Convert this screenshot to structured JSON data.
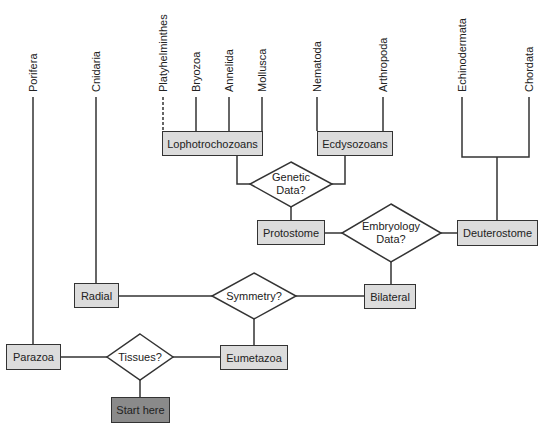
{
  "diagram": {
    "type": "phylogenetic decision flowchart",
    "leaves": [
      {
        "id": "porifera",
        "label": "Porifera",
        "x": 33
      },
      {
        "id": "cnidaria",
        "label": "Cnidaria",
        "x": 96
      },
      {
        "id": "platyhelminthes",
        "label": "Platyhelminthes",
        "x": 163,
        "dashed": true
      },
      {
        "id": "bryozoa",
        "label": "Bryozoa",
        "x": 196
      },
      {
        "id": "annelida",
        "label": "Annelida",
        "x": 229
      },
      {
        "id": "mollusca",
        "label": "Mollusca",
        "x": 262
      },
      {
        "id": "nematoda",
        "label": "Nematoda",
        "x": 317
      },
      {
        "id": "arthropoda",
        "label": "Arthropoda",
        "x": 383
      },
      {
        "id": "echinodermata",
        "label": "Echinodermata",
        "x": 462
      },
      {
        "id": "chordata",
        "label": "Chordata",
        "x": 529
      }
    ],
    "boxes": {
      "lophotrochozoans": "Lophotrochozoans",
      "ecdysozoans": "Ecdysozoans",
      "protostome": "Protostome",
      "deuterostome": "Deuterostome",
      "radial": "Radial",
      "bilateral": "Bilateral",
      "parazoa": "Parazoa",
      "eumetazoa": "Eumetazoa",
      "start": "Start here"
    },
    "decisions": {
      "genetic": "Genetic Data?",
      "embryology": "Embryology Data?",
      "symmetry": "Symmetry?",
      "tissues": "Tissues?"
    },
    "colors": {
      "box_fill": "#dcdcdc",
      "start_fill": "#8a8a8a",
      "line": "#333333"
    }
  }
}
